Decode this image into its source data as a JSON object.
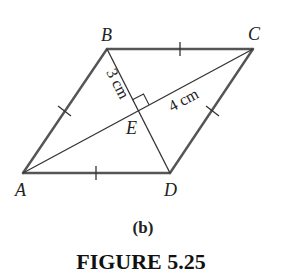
{
  "figure": {
    "shape": "rhombus",
    "vertices": {
      "A": {
        "label": "A",
        "x": 23,
        "y": 173
      },
      "B": {
        "label": "B",
        "x": 107,
        "y": 49
      },
      "C": {
        "label": "C",
        "x": 253,
        "y": 49
      },
      "D": {
        "label": "D",
        "x": 170,
        "y": 173
      },
      "E": {
        "label": "E",
        "x": 138,
        "y": 111
      }
    },
    "measurements": {
      "BE": "3 cm",
      "EC": "4 cm"
    },
    "sub_label": "(b)",
    "caption": "FIGURE 5.25",
    "colors": {
      "edge": "#555555",
      "diagonal": "#333333",
      "text": "#222222"
    }
  }
}
